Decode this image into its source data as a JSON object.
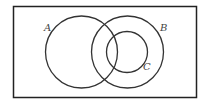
{
  "diagram": {
    "type": "venn",
    "universe": {
      "x": 13.5,
      "y": 6.5,
      "width": 183,
      "height": 91,
      "stroke": "#222222"
    },
    "sets": [
      {
        "label": "A",
        "cx": 81.5,
        "cy": 52,
        "r": 36,
        "label_x": 44,
        "label_y": 31
      },
      {
        "label": "B",
        "cx": 127.5,
        "cy": 52,
        "r": 36,
        "label_x": 160,
        "label_y": 31
      },
      {
        "label": "C",
        "cx": 127,
        "cy": 52,
        "r": 20.5,
        "label_x": 143,
        "label_y": 70
      }
    ],
    "relations": [
      "C is a subset of B",
      "A overlaps B",
      "A overlaps C"
    ]
  }
}
